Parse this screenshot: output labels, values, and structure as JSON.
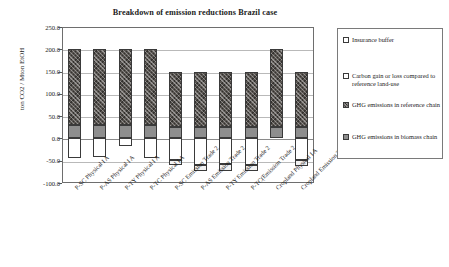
{
  "chart_data": {
    "type": "bar",
    "subtype": "stacked-bar",
    "title": "Breakdown of emission reductions Brazil case",
    "xlabel": "",
    "ylabel": "ton CO2 / Mton EtOH",
    "ylim": [
      -100.0,
      250.0
    ],
    "ytick_labels": [
      "250.0",
      "200.0",
      "150.0",
      "100.0",
      "50.0",
      "0.0",
      "-50.0",
      "-100.0"
    ],
    "ytick_values": [
      250.0,
      200.0,
      150.0,
      100.0,
      50.0,
      0.0,
      -50.0,
      -100.0
    ],
    "grid": true,
    "legend_position": "right",
    "categories": [
      "P-SC Physical I A",
      "P-AS Physical I A",
      "P-TY Physical I A",
      "P-TC Physical I A",
      "P-SC Emission Trade 2",
      "P-AS Emission Trade 2",
      "P-TY Emission Trade 2",
      "P-TC(Emission Trade 2",
      "Cropland Physical I A",
      "Cropland Emission Trade 2"
    ],
    "series": [
      {
        "name": "Insurance buffer",
        "key": "buffer",
        "values": [
          0,
          0,
          0,
          0,
          -12,
          -14,
          -14,
          -14,
          0,
          -14
        ]
      },
      {
        "name": "Carbon gain or loss compared to reference land-use",
        "key": "carbon",
        "values": [
          -45,
          -42,
          -16,
          -45,
          -48,
          -60,
          -58,
          -60,
          0,
          -48
        ]
      },
      {
        "name": "GHG  emissions in reference chain",
        "key": "reference",
        "values": [
          170,
          170,
          170,
          170,
          125,
          125,
          125,
          125,
          175,
          125
        ]
      },
      {
        "name": "GHG  emissions in biomass chain",
        "key": "biomass",
        "values": [
          30,
          30,
          30,
          30,
          25,
          25,
          25,
          25,
          25,
          25
        ]
      }
    ]
  },
  "legend": {
    "items": [
      {
        "label": "Insurance buffer",
        "key": "buffer"
      },
      {
        "label": "Carbon gain or loss compared to reference land-use",
        "key": "carbon"
      },
      {
        "label": "GHG  emissions in reference chain",
        "key": "reference"
      },
      {
        "label": "GHG  emissions in biomass chain",
        "key": "biomass"
      }
    ]
  }
}
